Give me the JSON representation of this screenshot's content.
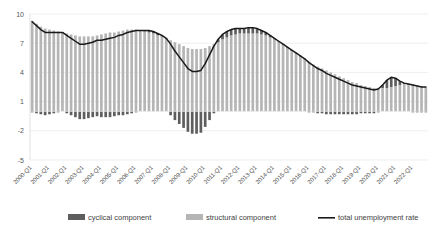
{
  "chart_data": {
    "type": "bar",
    "title": "",
    "subtitle": "",
    "xlabel": "",
    "ylabel": "",
    "ylim": [
      -5,
      10
    ],
    "yticks": [
      10,
      7,
      4,
      1,
      -2,
      -5
    ],
    "ytick_labels": [
      "10",
      "7",
      "4",
      "1",
      "-2",
      "-5"
    ],
    "grid": true,
    "stacked": true,
    "legend_position": "bottom",
    "legend": [
      {
        "label": "cyclical component",
        "marker": "bar",
        "color": "#5e5e5e"
      },
      {
        "label": "structural component",
        "marker": "bar",
        "color": "#b5b5b5"
      },
      {
        "label": "total unemployment rate",
        "marker": "line",
        "color": "#1a1a1a"
      }
    ],
    "xtick_labels": [
      "2000-Q1",
      "2001-Q1",
      "2002-Q1",
      "2003-Q1",
      "2004-Q1",
      "2005-Q1",
      "2006-Q1",
      "2007-Q1",
      "2008-Q1",
      "2009-Q1",
      "2010-Q1",
      "2011-Q1",
      "2012-Q1",
      "2013-Q1",
      "2014-Q1",
      "2015-Q1",
      "2016-Q1",
      "2017-Q1",
      "2018-Q1",
      "2019-Q1",
      "2020-Q1",
      "2021-Q1",
      "2022-Q1"
    ],
    "categories": [
      "2000-Q1",
      "2000-Q2",
      "2000-Q3",
      "2000-Q4",
      "2001-Q1",
      "2001-Q2",
      "2001-Q3",
      "2001-Q4",
      "2002-Q1",
      "2002-Q2",
      "2002-Q3",
      "2002-Q4",
      "2003-Q1",
      "2003-Q2",
      "2003-Q3",
      "2003-Q4",
      "2004-Q1",
      "2004-Q2",
      "2004-Q3",
      "2004-Q4",
      "2005-Q1",
      "2005-Q2",
      "2005-Q3",
      "2005-Q4",
      "2006-Q1",
      "2006-Q2",
      "2006-Q3",
      "2006-Q4",
      "2007-Q1",
      "2007-Q2",
      "2007-Q3",
      "2007-Q4",
      "2008-Q1",
      "2008-Q2",
      "2008-Q3",
      "2008-Q4",
      "2009-Q1",
      "2009-Q2",
      "2009-Q3",
      "2009-Q4",
      "2010-Q1",
      "2010-Q2",
      "2010-Q3",
      "2010-Q4",
      "2011-Q1",
      "2011-Q2",
      "2011-Q3",
      "2011-Q4",
      "2012-Q1",
      "2012-Q2",
      "2012-Q3",
      "2012-Q4",
      "2013-Q1",
      "2013-Q2",
      "2013-Q3",
      "2013-Q4",
      "2014-Q1",
      "2014-Q2",
      "2014-Q3",
      "2014-Q4",
      "2015-Q1",
      "2015-Q2",
      "2015-Q3",
      "2015-Q4",
      "2016-Q1",
      "2016-Q2",
      "2016-Q3",
      "2016-Q4",
      "2017-Q1",
      "2017-Q2",
      "2017-Q3",
      "2017-Q4",
      "2018-Q1",
      "2018-Q2",
      "2018-Q3",
      "2018-Q4",
      "2019-Q1",
      "2019-Q2",
      "2019-Q3",
      "2019-Q4",
      "2020-Q1",
      "2020-Q2",
      "2020-Q3",
      "2020-Q4",
      "2021-Q1",
      "2021-Q2",
      "2021-Q3",
      "2021-Q4",
      "2022-Q1",
      "2022-Q2",
      "2022-Q3",
      "2022-Q4"
    ],
    "series": [
      {
        "name": "structural component",
        "type": "bar",
        "color": "#b5b5b5",
        "values": [
          9.3,
          9.0,
          8.7,
          8.5,
          8.4,
          8.3,
          8.2,
          8.1,
          8.0,
          7.9,
          7.8,
          7.7,
          7.7,
          7.7,
          7.7,
          7.8,
          7.9,
          8.0,
          8.1,
          8.1,
          8.2,
          8.3,
          8.4,
          8.4,
          8.4,
          8.3,
          8.2,
          8.1,
          8.0,
          7.8,
          7.7,
          7.5,
          7.3,
          7.1,
          6.9,
          6.7,
          6.5,
          6.4,
          6.4,
          6.4,
          6.5,
          6.7,
          6.9,
          7.1,
          7.4,
          7.6,
          7.8,
          7.9,
          8.0,
          8.0,
          8.0,
          8.0,
          8.0,
          7.9,
          7.8,
          7.6,
          7.4,
          7.1,
          6.9,
          6.6,
          6.3,
          6.0,
          5.7,
          5.4,
          5.1,
          4.8,
          4.6,
          4.4,
          4.2,
          4.0,
          3.8,
          3.6,
          3.4,
          3.2,
          3.0,
          2.9,
          2.7,
          2.6,
          2.5,
          2.4,
          2.4,
          2.4,
          2.4,
          2.5,
          2.6,
          2.7,
          2.8,
          2.8,
          2.8,
          2.7,
          2.6,
          2.5
        ]
      },
      {
        "name": "cyclical component",
        "type": "bar",
        "color": "#5e5e5e",
        "values": [
          -0.1,
          -0.2,
          -0.3,
          -0.4,
          -0.3,
          -0.2,
          -0.1,
          0.0,
          -0.2,
          -0.4,
          -0.6,
          -0.8,
          -0.8,
          -0.7,
          -0.6,
          -0.5,
          -0.6,
          -0.6,
          -0.6,
          -0.5,
          -0.4,
          -0.4,
          -0.3,
          -0.2,
          -0.1,
          0.0,
          0.1,
          0.2,
          0.2,
          0.2,
          0.1,
          0.0,
          -0.4,
          -0.9,
          -1.3,
          -1.7,
          -2.1,
          -2.3,
          -2.3,
          -2.2,
          -1.6,
          -0.9,
          -0.2,
          0.3,
          0.5,
          0.6,
          0.6,
          0.6,
          0.5,
          0.5,
          0.6,
          0.6,
          0.5,
          0.4,
          0.3,
          0.2,
          0.1,
          0.1,
          0.0,
          0.0,
          0.0,
          0.0,
          0.0,
          0.0,
          -0.1,
          -0.1,
          -0.2,
          -0.2,
          -0.3,
          -0.3,
          -0.3,
          -0.3,
          -0.3,
          -0.3,
          -0.3,
          -0.3,
          -0.2,
          -0.2,
          -0.2,
          -0.2,
          -0.1,
          0.3,
          0.8,
          1.0,
          0.8,
          0.4,
          0.1,
          0.0,
          -0.1,
          -0.1,
          -0.1,
          -0.1
        ]
      },
      {
        "name": "total unemployment rate",
        "type": "line",
        "color": "#1a1a1a",
        "values": [
          9.2,
          8.8,
          8.4,
          8.1,
          8.1,
          8.1,
          8.1,
          8.1,
          7.8,
          7.5,
          7.2,
          6.9,
          6.9,
          7.0,
          7.1,
          7.3,
          7.3,
          7.4,
          7.5,
          7.6,
          7.8,
          7.9,
          8.1,
          8.2,
          8.3,
          8.3,
          8.3,
          8.3,
          8.2,
          8.0,
          7.8,
          7.5,
          6.9,
          6.2,
          5.6,
          5.0,
          4.4,
          4.1,
          4.1,
          4.2,
          4.9,
          5.8,
          6.7,
          7.4,
          7.9,
          8.2,
          8.4,
          8.5,
          8.5,
          8.5,
          8.6,
          8.6,
          8.5,
          8.3,
          8.1,
          7.8,
          7.5,
          7.2,
          6.9,
          6.6,
          6.3,
          6.0,
          5.7,
          5.4,
          5.0,
          4.7,
          4.4,
          4.2,
          3.9,
          3.7,
          3.5,
          3.3,
          3.1,
          2.9,
          2.7,
          2.6,
          2.5,
          2.4,
          2.3,
          2.2,
          2.3,
          2.7,
          3.2,
          3.5,
          3.4,
          3.1,
          2.9,
          2.8,
          2.7,
          2.6,
          2.5,
          2.5
        ]
      }
    ]
  }
}
